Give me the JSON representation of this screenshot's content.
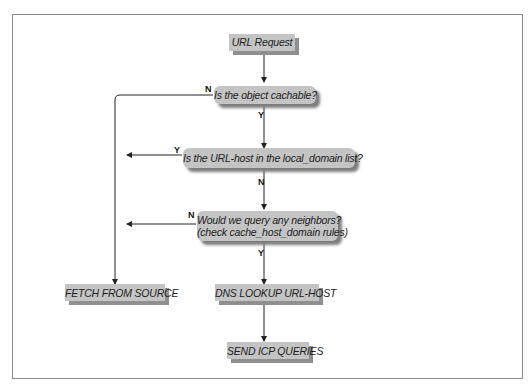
{
  "diagram": {
    "nodes": {
      "url_request": "URL Request",
      "cachable": "Is the object cachable?",
      "local_domain": "Is the URL-host in the local_domain list?",
      "neighbors_line1": "Would we query any neighbors?",
      "neighbors_line2": "(check cache_host_domain rules)",
      "fetch": "FETCH FROM SOURCE",
      "dns": "DNS LOOKUP URL-HOST",
      "icp": "SEND ICP QUERIES"
    },
    "edge_labels": {
      "cachable_no": "N",
      "cachable_yes": "Y",
      "local_yes": "Y",
      "local_no": "N",
      "neighbors_no": "N",
      "neighbors_yes": "Y"
    },
    "colors": {
      "node_fill": "#c4c4c4",
      "node_shadow": "#8f8f8f",
      "line": "#222222",
      "frame": "#8a8a8a"
    }
  }
}
